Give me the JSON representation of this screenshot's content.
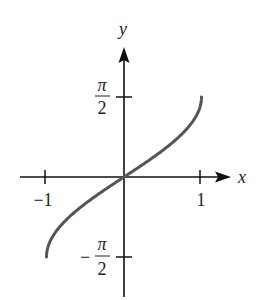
{
  "chart_data": {
    "type": "line",
    "title": "",
    "function": "y = arcsin(x)",
    "xlabel": "x",
    "ylabel": "y",
    "xlim": [
      -1,
      1
    ],
    "ylim": [
      -1.5708,
      1.5708
    ],
    "grid": false,
    "legend": null,
    "x_ticks": [
      {
        "value": -1,
        "label": "−1"
      },
      {
        "value": 1,
        "label": "1"
      }
    ],
    "y_ticks": [
      {
        "value": 1.5708,
        "label_num": "π",
        "label_den": "2",
        "sign": ""
      },
      {
        "value": -1.5708,
        "label_num": "π",
        "label_den": "2",
        "sign": "−"
      }
    ],
    "series": [
      {
        "name": "arcsin",
        "color": "#555555",
        "x": [
          -1,
          -0.95,
          -0.9,
          -0.8,
          -0.6,
          -0.4,
          -0.2,
          0,
          0.2,
          0.4,
          0.6,
          0.8,
          0.9,
          0.95,
          1
        ],
        "y": [
          -1.5708,
          -1.2532,
          -1.1198,
          -0.9273,
          -0.6435,
          -0.4115,
          -0.2014,
          0,
          0.2014,
          0.4115,
          0.6435,
          0.9273,
          1.1198,
          1.2532,
          1.5708
        ]
      }
    ]
  },
  "axes": {
    "x_label": "x",
    "y_label": "y",
    "axis_color": "#111111",
    "curve_color": "#555555"
  }
}
